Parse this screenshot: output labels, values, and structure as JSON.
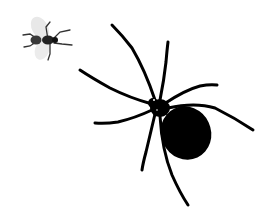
{
  "image": {
    "description": "Black silhouette illustration of a spider facing a small fly on a white background",
    "background": "#ffffff",
    "subjects": [
      {
        "name": "fly",
        "color": "#222222",
        "wing_color": "#e6e6e6"
      },
      {
        "name": "spider",
        "color": "#000000"
      }
    ]
  }
}
